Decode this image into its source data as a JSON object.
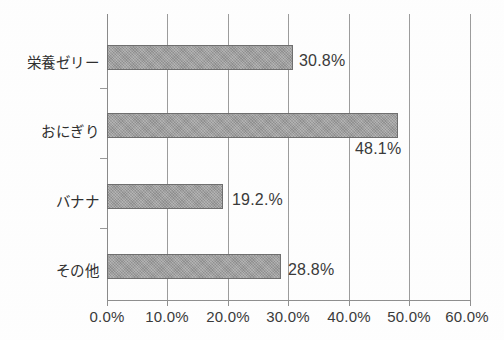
{
  "chart_data": {
    "type": "bar",
    "orientation": "horizontal",
    "title": "",
    "subtitle": "",
    "xlabel": "",
    "ylabel": "",
    "categories": [
      "栄養ゼリー",
      "おにぎり",
      "バナナ",
      "その他"
    ],
    "values": [
      30.8,
      48.1,
      19.2,
      28.8
    ],
    "value_labels": [
      "30.8%",
      "48.1%",
      "19.2.%",
      "28.8%"
    ],
    "xlim": [
      0,
      60
    ],
    "xticks": [
      0,
      10,
      20,
      30,
      40,
      50,
      60
    ],
    "xtick_labels": [
      "0.0%",
      "10.0%",
      "20.0%",
      "30.0%",
      "40.0%",
      "50.0%",
      "60.0%"
    ],
    "grid": true,
    "grid_axis": "x",
    "legend": false,
    "legend_position": "none",
    "bar_color": "#9d9d9d",
    "bar_edge_color": "#6f6f6f",
    "axis_color": "#8f8f8f",
    "text_color": "#3a3a3a",
    "background_color": "#fefefe"
  },
  "bars": [
    {
      "category": "栄養ゼリー",
      "value": 30.8,
      "label": "30.8%",
      "label_placement": "right-of-bar"
    },
    {
      "category": "おにぎり",
      "value": 48.1,
      "label": "48.1%",
      "label_placement": "below-bar-end"
    },
    {
      "category": "バナナ",
      "value": 19.2,
      "label": "19.2.%",
      "label_placement": "right-of-bar"
    },
    {
      "category": "その他",
      "value": 28.8,
      "label": "28.8%",
      "label_placement": "right-of-bar"
    }
  ],
  "axis": {
    "ticks": [
      {
        "label": "0.0%",
        "value": 0
      },
      {
        "label": "10.0%",
        "value": 10
      },
      {
        "label": "20.0%",
        "value": 20
      },
      {
        "label": "30.0%",
        "value": 30
      },
      {
        "label": "40.0%",
        "value": 40
      },
      {
        "label": "50.0%",
        "value": 50
      },
      {
        "label": "60.0%",
        "value": 60
      }
    ]
  }
}
